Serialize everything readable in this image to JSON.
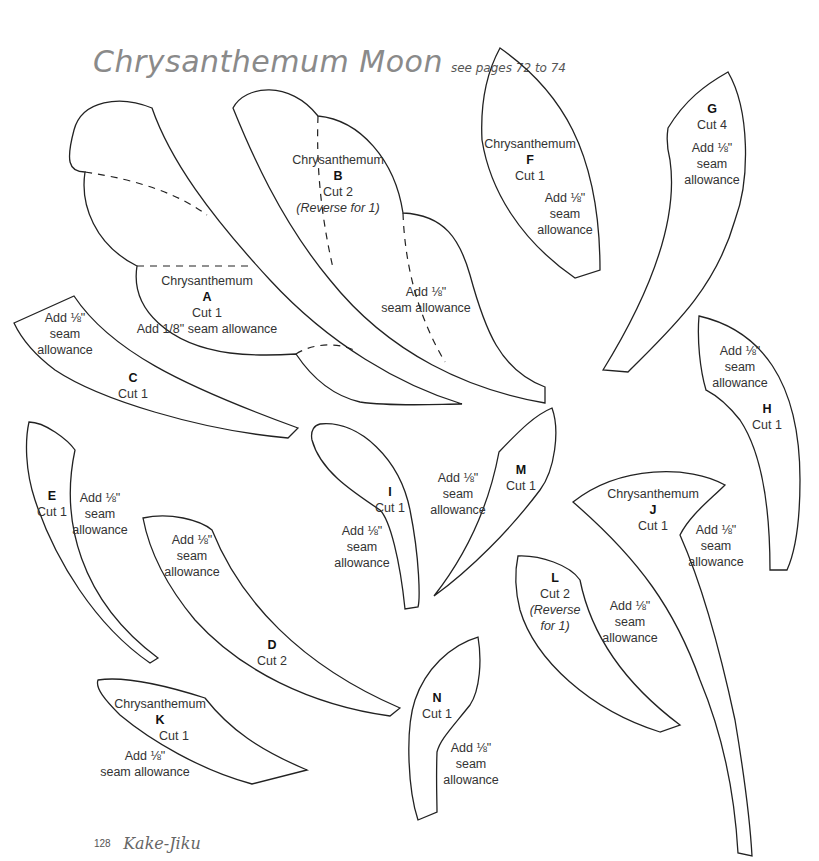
{
  "page": {
    "title": "Chrysanthemum Moon",
    "subtitle": "see pages 72 to 74",
    "page_number": "128",
    "book_title": "Kake-Jiku",
    "stroke_color": "#222222",
    "title_color": "#8a8a8a"
  },
  "pieces": {
    "A": {
      "name": "Chrysanthemum",
      "letter": "A",
      "cut": "Cut 1",
      "seam": "Add 1/8\" seam allowance"
    },
    "B": {
      "name": "Chrysanthemum",
      "letter": "B",
      "cut": "Cut 2",
      "note": "(Reverse for 1)",
      "seam1": "Add ⅛\"",
      "seam2": "seam allowance"
    },
    "C": {
      "letter": "C",
      "cut": "Cut 1",
      "seam1": "Add ⅛\"",
      "seam2": "seam",
      "seam3": "allowance"
    },
    "D": {
      "letter": "D",
      "cut": "Cut 2",
      "seam1": "Add ⅛\"",
      "seam2": "seam",
      "seam3": "allowance"
    },
    "E": {
      "letter": "E",
      "cut": "Cut 1",
      "seam1": "Add ⅛\"",
      "seam2": "seam",
      "seam3": "allowance"
    },
    "F": {
      "name": "Chrysanthemum",
      "letter": "F",
      "cut": "Cut 1",
      "seam1": "Add ⅛\"",
      "seam2": "seam",
      "seam3": "allowance"
    },
    "G": {
      "letter": "G",
      "cut": "Cut 4",
      "seam1": "Add ⅛\"",
      "seam2": "seam",
      "seam3": "allowance"
    },
    "H": {
      "letter": "H",
      "cut": "Cut 1",
      "seam1": "Add ⅛\"",
      "seam2": "seam",
      "seam3": "allowance"
    },
    "I": {
      "letter": "I",
      "cut": "Cut 1",
      "seam1": "Add ⅛\"",
      "seam2": "seam",
      "seam3": "allowance"
    },
    "J": {
      "name": "Chrysanthemum",
      "letter": "J",
      "cut": "Cut 1",
      "seam1": "Add ⅛\"",
      "seam2": "seam",
      "seam3": "allowance"
    },
    "K": {
      "name": "Chrysanthemum",
      "letter": "K",
      "cut": "Cut 1",
      "seam1": "Add ⅛\"",
      "seam2": "seam allowance"
    },
    "L": {
      "letter": "L",
      "cut": "Cut 2",
      "note1": "(Reverse",
      "note2": "for 1)",
      "seam1": "Add ⅛\"",
      "seam2": "seam",
      "seam3": "allowance"
    },
    "M": {
      "letter": "M",
      "cut": "Cut 1",
      "seam1": "Add ⅛\"",
      "seam2": "seam",
      "seam3": "allowance"
    },
    "N": {
      "letter": "N",
      "cut": "Cut 1",
      "seam1": "Add ⅛\"",
      "seam2": "seam",
      "seam3": "allowance"
    }
  }
}
